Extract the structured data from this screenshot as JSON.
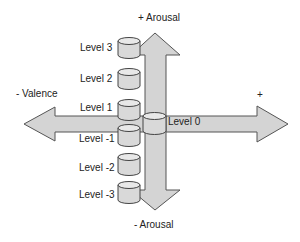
{
  "diagram": {
    "axes": {
      "arousal_positive": "+ Arousal",
      "arousal_negative": "- Arousal",
      "valence_negative": "- Valence",
      "valence_positive": "+"
    },
    "levels": [
      {
        "label": "Level 3"
      },
      {
        "label": "Level 2"
      },
      {
        "label": "Level 1"
      },
      {
        "label": "Level 0"
      },
      {
        "label": "Level -1"
      },
      {
        "label": "Level -2"
      },
      {
        "label": "Level -3"
      }
    ],
    "colors": {
      "arrow_fill": "#d4d4d4",
      "arrow_stroke": "#555555",
      "cylinder_fill": "#d9d9d9",
      "cylinder_top": "#e8e8e8"
    }
  }
}
